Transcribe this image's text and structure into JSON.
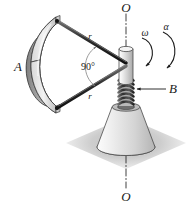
{
  "figure": {
    "type": "mechanics-diagram",
    "background_color": "#ffffff",
    "labels": {
      "axis_top": "O",
      "axis_bottom": "O",
      "plate": "A",
      "spring": "B",
      "rod_upper": "r",
      "rod_lower": "r",
      "angle": "90°",
      "angular_velocity": "ω",
      "angular_acceleration": "α"
    },
    "colors": {
      "outline": "#1a1a1a",
      "plate_outer": "#e8e8e8",
      "plate_inner": "#9a9a9a",
      "plate_edge": "#c4c4c4",
      "rod": "#3a3a3a",
      "shaft": "#d4d4d4",
      "spring": "#4a4a4a",
      "cone": "#dcdcdc",
      "shadow": "#c6c6c6",
      "leader": "#1a1a1a"
    },
    "geometry": {
      "shaft_axis_x": 126,
      "axis_top_y": 8,
      "axis_bottom_y": 196,
      "rod_hub": [
        126,
        64
      ],
      "rod_upper_end": [
        55,
        22
      ],
      "rod_lower_end": [
        55,
        104
      ],
      "spring_turns": 7
    }
  }
}
